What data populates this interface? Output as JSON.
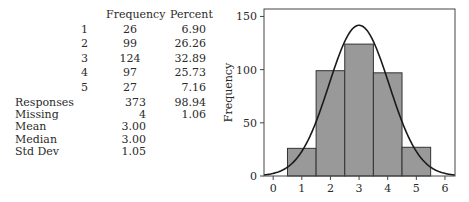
{
  "table": {
    "headers": [
      "Frequency",
      "Percent"
    ],
    "rows": [
      {
        "label": "1",
        "frequency": "26",
        "percent": "6.90"
      },
      {
        "label": "2",
        "frequency": "99",
        "percent": "26.26"
      },
      {
        "label": "3",
        "frequency": "124",
        "percent": "32.89"
      },
      {
        "label": "4",
        "frequency": "97",
        "percent": "25.73"
      },
      {
        "label": "5",
        "frequency": "27",
        "percent": "7.16"
      }
    ],
    "summary": [
      {
        "label": "Responses",
        "frequency": "373",
        "percent": "98.94"
      },
      {
        "label": "Missing",
        "frequency": "4",
        "percent": "1.06"
      },
      {
        "label": "Mean",
        "frequency": "3.00",
        "percent": ""
      },
      {
        "label": "Median",
        "frequency": "3.00",
        "percent": ""
      },
      {
        "label": "Std Dev",
        "frequency": "1.05",
        "percent": ""
      }
    ]
  },
  "chart_data": {
    "type": "bar",
    "title": "",
    "xlabel": "",
    "ylabel": "Frequency",
    "categories": [
      "1",
      "2",
      "3",
      "4",
      "5"
    ],
    "values": [
      26,
      99,
      124,
      97,
      27
    ],
    "bar_color": "#999999",
    "x_ticks": [
      "0",
      "1",
      "2",
      "3",
      "4",
      "5",
      "6"
    ],
    "y_ticks": [
      "0",
      "50",
      "100",
      "150"
    ],
    "xlim": [
      -0.32,
      6.35
    ],
    "ylim": [
      0,
      157
    ],
    "grid": false,
    "legend": null,
    "overlay": {
      "type": "normal_curve",
      "mean": 3.0,
      "sd": 1.05,
      "n": 373,
      "bin_width": 1
    }
  }
}
